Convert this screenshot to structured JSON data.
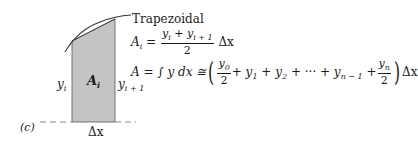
{
  "figure": {
    "panel_label": "(c)",
    "method_title": "Trapezoidal",
    "labels": {
      "left_height": "y",
      "left_height_sub": "i",
      "area": "A",
      "area_sub": "i",
      "right_height": "y",
      "right_height_sub": "i + 1",
      "width": "Δx"
    },
    "colors": {
      "shaded_fill": "#c4c4c4",
      "curve": "#333333",
      "dashed_baseline": "#888888"
    }
  },
  "formula1": {
    "lhs": "A",
    "lhs_sub": "i",
    "eq": "=",
    "numerator": "y",
    "num_sub1": "i",
    "num_plus": " + y",
    "num_sub2": "i + 1",
    "denominator": "2",
    "tail": "Δx"
  },
  "formula2": {
    "lhs": "A = ∫ y dx ≅",
    "t0_num": "y",
    "t0_sub": "0",
    "t0_den": "2",
    "mid1": "+ y",
    "mid1_sub": "1",
    "mid2": " + y",
    "mid2_sub": "2",
    "mid3": " + ··· + y",
    "mid3_sub": "n − 1",
    "mid4": " +",
    "tn_num": "y",
    "tn_sub": "n",
    "tn_den": "2",
    "tail": "Δx"
  }
}
